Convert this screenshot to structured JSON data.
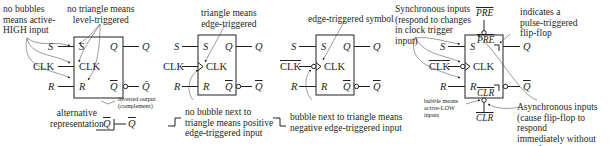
{
  "diagram": {
    "panels": [
      {
        "id": "level-triggered",
        "inputs": [
          "S",
          "CLK",
          "R"
        ],
        "outputs": [
          "Q",
          "Q̄"
        ],
        "inner_labels": [
          "S",
          "CLK",
          "R",
          "Q",
          "Q"
        ],
        "annotations": {
          "no_bubbles": "no bubbles\nmeans active-\nHIGH input",
          "no_triangle": "no triangle means\nlevel-triggered",
          "inverted_output": "inverted output\n(complement)",
          "alternative": "alternative\nrepresentation",
          "alt_inner": "Q",
          "alt_output": "Q"
        }
      },
      {
        "id": "positive-edge",
        "inputs": [
          "S",
          "CLK",
          "R"
        ],
        "outputs": [
          "Q",
          "Q"
        ],
        "inner_labels": [
          "S",
          "CLK",
          "R",
          "Q",
          "Q"
        ],
        "annotations": {
          "triangle": "triangle means\nedge-triggered",
          "no_bubble_next": "no bubble next to\ntriangle means positive\nedge-triggered input"
        }
      },
      {
        "id": "negative-edge",
        "inputs": [
          "S",
          "CLK",
          "R"
        ],
        "outputs": [
          "Q",
          "Q"
        ],
        "inner_labels": [
          "S",
          "CLK",
          "R",
          "Q",
          "Q"
        ],
        "annotations": {
          "edge_symbol": "edge-triggered symbol",
          "bubble_next": "bubble next to triangle means\nnegative edge-triggered input"
        }
      },
      {
        "id": "pulse-triggered",
        "inputs": [
          "S",
          "CLK",
          "R"
        ],
        "outputs": [
          "Q",
          "Q"
        ],
        "async_inputs": [
          "PRE",
          "CLR"
        ],
        "inner_labels": [
          "S",
          "CLK",
          "R",
          "PRE",
          "CLR"
        ],
        "annotations": {
          "synchronous": "Synchronous inputs\n(respond to changes\nin clock trigger\ninput)",
          "pulse": "indicates a\npulse-triggered\nflip-flop",
          "bubble_active_low": "bubble means\nactive-LOW\ninputs",
          "asynchronous": "Asynchronous inputs\n(cause flip-flop to respond\nimmediately without regard\nto clock trigger inputs)"
        }
      }
    ],
    "colors": {
      "line": "#231f20",
      "arrow": "#58595b",
      "background": "#ffffff"
    }
  }
}
